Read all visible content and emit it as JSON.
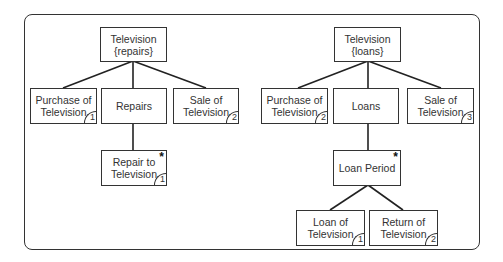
{
  "trees": [
    {
      "root": {
        "id": "tv-repairs",
        "label": "Television\n{repairs}"
      },
      "children": [
        {
          "id": "purchase-1",
          "label": "Purchase of\nTelevision",
          "sequence": "1"
        },
        {
          "id": "repairs",
          "label": "Repairs"
        },
        {
          "id": "sale-1",
          "label": "Sale of\nTelevision",
          "sequence": "2"
        }
      ],
      "grandchildren": [
        {
          "id": "repair-to-tv",
          "label": "Repair to\nTelevision",
          "sequence": "1",
          "iteration": "*"
        }
      ]
    },
    {
      "root": {
        "id": "tv-loans",
        "label": "Television\n{loans}"
      },
      "children": [
        {
          "id": "purchase-2",
          "label": "Purchase of\nTelevision",
          "sequence": "2"
        },
        {
          "id": "loans",
          "label": "Loans"
        },
        {
          "id": "sale-2",
          "label": "Sale of\nTelevision",
          "sequence": "3"
        }
      ],
      "grandchildren": [
        {
          "id": "loan-period",
          "label": "Loan Period",
          "iteration": "*"
        }
      ],
      "great_grandchildren": [
        {
          "id": "loan-of-tv",
          "label": "Loan of\nTelevision",
          "sequence": "1"
        },
        {
          "id": "return-of-tv",
          "label": "Return of\nTelevision",
          "sequence": "2"
        }
      ]
    }
  ]
}
